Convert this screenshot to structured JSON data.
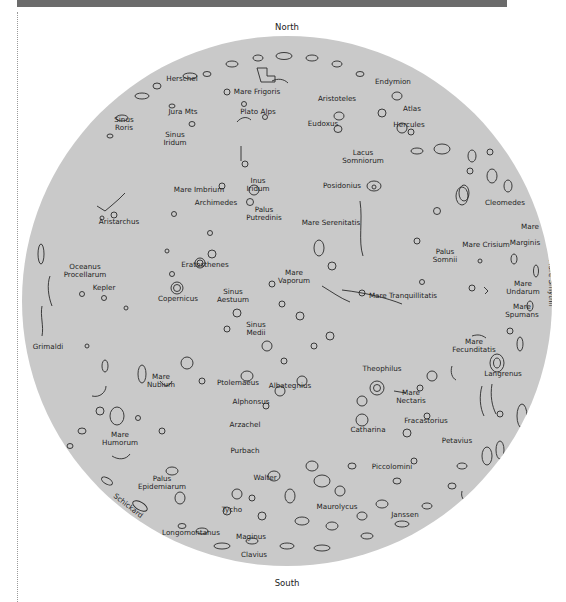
{
  "header": {
    "bar_color": "#6b6b6b"
  },
  "map": {
    "disk_color": "#c9c9c9",
    "north_label": "North",
    "south_label": "South",
    "features": [
      {
        "id": "herschel",
        "label": "Herschel",
        "x": 182,
        "y": 79
      },
      {
        "id": "mare-frigoris",
        "label": "Mare Frigoris",
        "x": 257,
        "y": 92
      },
      {
        "id": "aristoteles",
        "label": "Aristoteles",
        "x": 337,
        "y": 99
      },
      {
        "id": "endymion",
        "label": "Endymion",
        "x": 393,
        "y": 82
      },
      {
        "id": "sinus-roris",
        "label": "Sinus\nRoris",
        "x": 124,
        "y": 120
      },
      {
        "id": "jura-mts",
        "label": "Jura Mts",
        "x": 183,
        "y": 112
      },
      {
        "id": "plato-alps",
        "label": "Plato Alps",
        "x": 258,
        "y": 112
      },
      {
        "id": "eudoxus",
        "label": "Eudoxus",
        "x": 323,
        "y": 124
      },
      {
        "id": "atlas",
        "label": "Atlas",
        "x": 412,
        "y": 109
      },
      {
        "id": "hercules",
        "label": "Hercules",
        "x": 409,
        "y": 125
      },
      {
        "id": "sinus-iridum",
        "label": "Sinus\nIridum",
        "x": 175,
        "y": 135
      },
      {
        "id": "lacus-somniorum",
        "label": "Lacus\nSomniorum",
        "x": 363,
        "y": 153
      },
      {
        "id": "inus-iridum",
        "label": "Inus\nIridum",
        "x": 258,
        "y": 181
      },
      {
        "id": "posidonius",
        "label": "Posidonius",
        "x": 342,
        "y": 186
      },
      {
        "id": "mare-imbrium",
        "label": "Mare Imbrium",
        "x": 199,
        "y": 190
      },
      {
        "id": "archimedes",
        "label": "Archimedes",
        "x": 216,
        "y": 203
      },
      {
        "id": "cleomedes",
        "label": "Cleomedes",
        "x": 505,
        "y": 203
      },
      {
        "id": "aristarchus",
        "label": "Aristarchus",
        "x": 119,
        "y": 222
      },
      {
        "id": "palus-putredinis",
        "label": "Palus\nPutredinis",
        "x": 264,
        "y": 210
      },
      {
        "id": "mare-serenitatis",
        "label": "Mare Serenitatis",
        "x": 331,
        "y": 223
      },
      {
        "id": "mare",
        "label": "Mare",
        "x": 530,
        "y": 227
      },
      {
        "id": "mare-crisium",
        "label": "Mare Crisium",
        "x": 486,
        "y": 245
      },
      {
        "id": "marginis",
        "label": "Marginis",
        "x": 525,
        "y": 243
      },
      {
        "id": "palus-somnii",
        "label": "Palus\nSomnii",
        "x": 445,
        "y": 252
      },
      {
        "id": "eratosthenes",
        "label": "Eratosthenes",
        "x": 205,
        "y": 265
      },
      {
        "id": "oceanus-procellarum",
        "label": "Oceanus\nProcellarum",
        "x": 85,
        "y": 267
      },
      {
        "id": "mare-vaporum",
        "label": "Mare\nVaporum",
        "x": 294,
        "y": 273
      },
      {
        "id": "kepler",
        "label": "Kepler",
        "x": 104,
        "y": 288
      },
      {
        "id": "mare-undarum",
        "label": "Mare\nUndarum",
        "x": 523,
        "y": 284
      },
      {
        "id": "sinus-aestuum",
        "label": "Sinus\nAestuum",
        "x": 233,
        "y": 292
      },
      {
        "id": "copernicus",
        "label": "Copernicus",
        "x": 178,
        "y": 299
      },
      {
        "id": "mare-tranquillitatis",
        "label": "Mare Tranquillitatis",
        "x": 403,
        "y": 296
      },
      {
        "id": "mare-spumans",
        "label": "Mare\nSpumans",
        "x": 522,
        "y": 307
      },
      {
        "id": "sinus-medii",
        "label": "Sinus\nMedii",
        "x": 256,
        "y": 325
      },
      {
        "id": "grimaldi",
        "label": "Grimaldi",
        "x": 48,
        "y": 347
      },
      {
        "id": "mare-fecunditatis",
        "label": "Mare\nFecunditatis",
        "x": 474,
        "y": 342
      },
      {
        "id": "theophilus",
        "label": "Theophilus",
        "x": 382,
        "y": 369
      },
      {
        "id": "mare-nubium",
        "label": "Mare\nNubium",
        "x": 161,
        "y": 377
      },
      {
        "id": "ptolemaeus",
        "label": "Ptolemaeus",
        "x": 238,
        "y": 383
      },
      {
        "id": "albategnius",
        "label": "Albategnius",
        "x": 290,
        "y": 386
      },
      {
        "id": "langrenus",
        "label": "Langrenus",
        "x": 503,
        "y": 374
      },
      {
        "id": "mare-nectaris",
        "label": "Mare\nNectaris",
        "x": 411,
        "y": 393
      },
      {
        "id": "alphonsus",
        "label": "Alphonsus",
        "x": 251,
        "y": 402
      },
      {
        "id": "fracastorius",
        "label": "Fracastorius",
        "x": 426,
        "y": 421
      },
      {
        "id": "arzachel",
        "label": "Arzachel",
        "x": 245,
        "y": 425
      },
      {
        "id": "mare-humorum",
        "label": "Mare\nHumorum",
        "x": 120,
        "y": 435
      },
      {
        "id": "catharina",
        "label": "Catharina",
        "x": 368,
        "y": 430
      },
      {
        "id": "petavius",
        "label": "Petavius",
        "x": 457,
        "y": 441
      },
      {
        "id": "purbach",
        "label": "Purbach",
        "x": 245,
        "y": 451
      },
      {
        "id": "piccolomini",
        "label": "Piccolomini",
        "x": 392,
        "y": 467
      },
      {
        "id": "palus-epidemiarum",
        "label": "Palus\nEpidemiarum",
        "x": 162,
        "y": 479
      },
      {
        "id": "walter",
        "label": "Walter",
        "x": 265,
        "y": 478
      },
      {
        "id": "tycho",
        "label": "Tycho",
        "x": 232,
        "y": 510
      },
      {
        "id": "maurolycus",
        "label": "Maurolycus",
        "x": 337,
        "y": 507
      },
      {
        "id": "janssen",
        "label": "Janssen",
        "x": 405,
        "y": 515
      },
      {
        "id": "longomontanus",
        "label": "Longomontanus",
        "x": 191,
        "y": 533
      },
      {
        "id": "maginus",
        "label": "Maginus",
        "x": 251,
        "y": 537
      },
      {
        "id": "clavius",
        "label": "Clavius",
        "x": 254,
        "y": 555
      }
    ],
    "rotated_features": [
      {
        "id": "mare-humboldtianum",
        "label": "Mare Humboldtianum",
        "x": 432,
        "y": 69,
        "angle": 30
      },
      {
        "id": "mare-smythii",
        "label": "Mare Smythii",
        "x": 551,
        "y": 283,
        "angle": 90
      },
      {
        "id": "mare-australe",
        "label": "Mare Australe",
        "x": 464,
        "y": 521,
        "angle": -48
      },
      {
        "id": "schickard",
        "label": "Schickard",
        "x": 128,
        "y": 506,
        "angle": 38
      }
    ]
  }
}
